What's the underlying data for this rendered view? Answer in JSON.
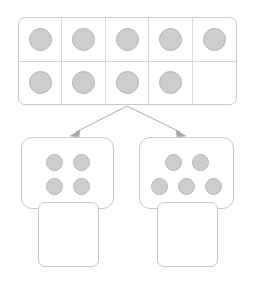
{
  "worksheet": {
    "type": "number-decomposition",
    "total_counters": 9,
    "colors": {
      "counter_fill": "#cdcdcd",
      "counter_border": "#b4b4b4",
      "frame_border": "#c5c7c9",
      "grid_line": "#d6d8da",
      "arrow": "#a8aaac",
      "background": "#ffffff"
    }
  },
  "ten_frame": {
    "name": "ten-frame",
    "columns": 5,
    "rows": 2,
    "filled_count": 9,
    "empty_count": 1,
    "cells": [
      [
        {
          "filled": true,
          "icon": "counter-circle"
        },
        {
          "filled": true,
          "icon": "counter-circle"
        },
        {
          "filled": true,
          "icon": "counter-circle"
        },
        {
          "filled": true,
          "icon": "counter-circle"
        },
        {
          "filled": true,
          "icon": "counter-circle"
        }
      ],
      [
        {
          "filled": true,
          "icon": "counter-circle"
        },
        {
          "filled": true,
          "icon": "counter-circle"
        },
        {
          "filled": true,
          "icon": "counter-circle"
        },
        {
          "filled": true,
          "icon": "counter-circle"
        },
        {
          "filled": false,
          "icon": "empty-cell"
        }
      ]
    ]
  },
  "arrows": [
    {
      "name": "arrow-to-left-part",
      "direction": "down-left",
      "icon": "arrow-icon"
    },
    {
      "name": "arrow-to-right-part",
      "direction": "down-right",
      "icon": "arrow-icon"
    }
  ],
  "parts": [
    {
      "name": "left-part",
      "counter_count": 4,
      "dot_rows": [
        2,
        2
      ],
      "answer_box": {
        "name": "left-answer-box",
        "value": "",
        "placeholder": ""
      }
    },
    {
      "name": "right-part",
      "counter_count": 5,
      "dot_rows": [
        2,
        3
      ],
      "answer_box": {
        "name": "right-answer-box",
        "value": "",
        "placeholder": ""
      }
    }
  ]
}
